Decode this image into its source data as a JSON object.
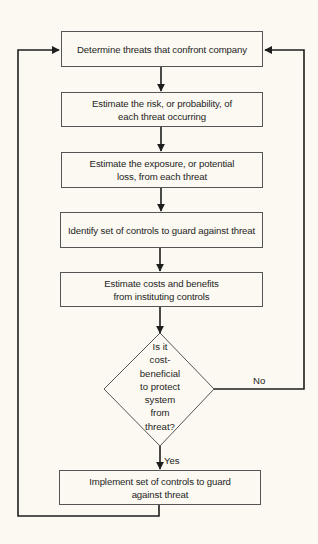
{
  "diagram": {
    "type": "flowchart",
    "steps": [
      {
        "id": "s1",
        "label": "Determine threats that confront company"
      },
      {
        "id": "s2",
        "label": "Estimate the risk, or probability, of each threat occurring"
      },
      {
        "id": "s3",
        "label": "Estimate the exposure, or potential loss, from each threat"
      },
      {
        "id": "s4",
        "label": "Identify set of controls to guard against threat"
      },
      {
        "id": "s5",
        "label": "Estimate costs and benefits from instituting controls"
      },
      {
        "id": "s6",
        "label": "Implement set of controls to guard against threat"
      }
    ],
    "decision": {
      "id": "d1",
      "label": "Is it cost-beneficial to protect system from threat?",
      "lines": [
        "Is it",
        "cost-",
        "beneficial",
        "to protect",
        "system",
        "from",
        "threat?"
      ],
      "yes_label": "Yes",
      "no_label": "No"
    },
    "edges": [
      {
        "from": "s1",
        "to": "s2"
      },
      {
        "from": "s2",
        "to": "s3"
      },
      {
        "from": "s3",
        "to": "s4"
      },
      {
        "from": "s4",
        "to": "s5"
      },
      {
        "from": "s5",
        "to": "d1"
      },
      {
        "from": "d1",
        "to": "s6",
        "label": "Yes"
      },
      {
        "from": "d1",
        "to": "s1",
        "label": "No"
      },
      {
        "from": "s6",
        "to": "s1"
      }
    ],
    "colors": {
      "background": "#fbf9f1",
      "line": "#1e1e1e",
      "box_border": "#555555"
    }
  }
}
